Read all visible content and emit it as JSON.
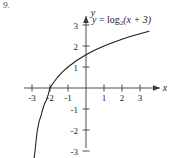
{
  "problem": {
    "number": "9."
  },
  "equation": {
    "lhs": "y",
    "equals": " = ",
    "fn": "log",
    "base": "2",
    "arg": "(x + 3)",
    "full": "y = log2(x + 3)"
  },
  "axes": {
    "x_label": "x",
    "y_label": "y",
    "x_ticks": [
      "-3",
      "-2",
      "-1",
      "1",
      "2",
      "3"
    ],
    "y_ticks": [
      "3",
      "2",
      "1",
      "-1",
      "-2",
      "-3"
    ],
    "x_tick_values": [
      -3,
      -2,
      -1,
      1,
      2,
      3
    ],
    "y_tick_values": [
      3,
      2,
      1,
      -1,
      -2,
      -3
    ]
  },
  "colors": {
    "background": "#ffffff",
    "axis": "#3a3a3a",
    "curve": "#1c1c1c",
    "text": "#1c1c1c",
    "number_text": "#4a4a4a"
  },
  "chart_data": {
    "type": "line",
    "title": "",
    "xlabel": "x",
    "ylabel": "y",
    "xlim": [
      -3.4,
      3.6
    ],
    "ylim": [
      -3.3,
      3.3
    ],
    "grid": false,
    "legend": "none",
    "annotations": [
      "y = log2(x + 3)"
    ],
    "series": [
      {
        "name": "y = log2(x + 3)",
        "function": "log2(x + 3)",
        "asymptote_x": -3,
        "x_intercept": -2,
        "x": [
          -2.92,
          -2.88,
          -2.84,
          -2.8,
          -2.75,
          -2.7,
          -2.6,
          -2.5,
          -2.4,
          -2.3,
          -2.2,
          -2.1,
          -2.0,
          -1.8,
          -1.6,
          -1.4,
          -1.2,
          -1.0,
          -0.5,
          0.0,
          0.5,
          1.0,
          1.5,
          2.0,
          2.5,
          3.0,
          3.5
        ],
        "y": [
          -3.64,
          -3.32,
          -3.06,
          -2.74,
          -2.32,
          -2.0,
          -1.58,
          -1.32,
          -1.0,
          -0.74,
          -0.58,
          -0.32,
          0.0,
          0.26,
          0.49,
          0.68,
          0.85,
          1.0,
          1.32,
          1.58,
          1.81,
          2.0,
          2.17,
          2.32,
          2.46,
          2.58,
          2.7
        ]
      }
    ]
  }
}
